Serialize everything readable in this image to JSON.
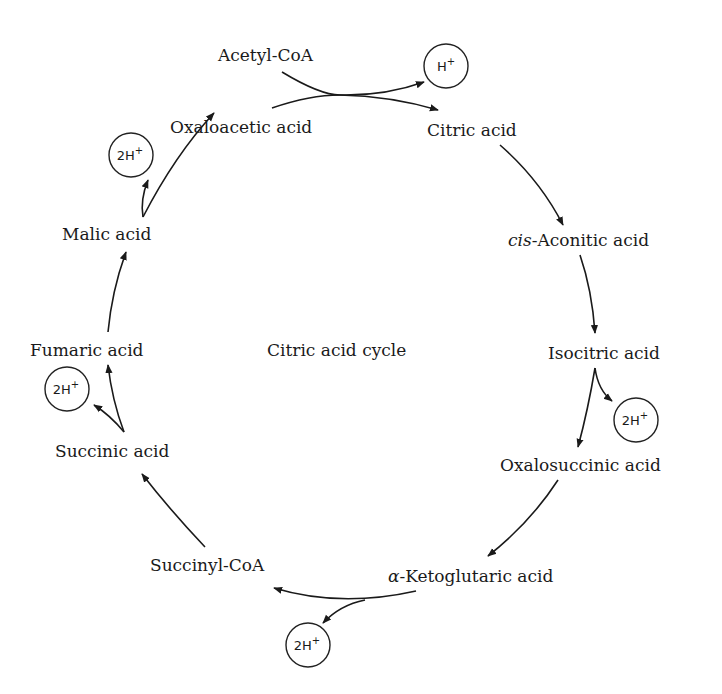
{
  "diagram": {
    "title": "Citric acid cycle",
    "nodes": [
      {
        "id": "acetyl_coa",
        "label": "Acetyl-CoA"
      },
      {
        "id": "oxaloacetic",
        "label": "Oxaloacetic acid"
      },
      {
        "id": "citric",
        "label": "Citric acid"
      },
      {
        "id": "cis_aconitic",
        "label_prefix": "cis",
        "label": "-Aconitic acid"
      },
      {
        "id": "isocitric",
        "label": "Isocitric acid"
      },
      {
        "id": "oxalosuccinic",
        "label": "Oxalosuccinic acid"
      },
      {
        "id": "ketoglutaric",
        "label_prefix": "α",
        "label": "-Ketoglutaric acid"
      },
      {
        "id": "succinyl_coa",
        "label": "Succinyl-CoA"
      },
      {
        "id": "succinic",
        "label": "Succinic acid"
      },
      {
        "id": "fumaric",
        "label": "Fumaric acid"
      },
      {
        "id": "malic",
        "label": "Malic acid"
      }
    ],
    "ions": [
      {
        "id": "h_citric",
        "text": "H",
        "sup": "+"
      },
      {
        "id": "h_isocitric",
        "text": "2H",
        "sup": "+"
      },
      {
        "id": "h_ketoglutaric",
        "text": "2H",
        "sup": "+"
      },
      {
        "id": "h_succinic",
        "text": "2H",
        "sup": "+"
      },
      {
        "id": "h_malic",
        "text": "2H",
        "sup": "+"
      }
    ],
    "edges": [
      {
        "from": "acetyl_coa+oxaloacetic",
        "to": "citric",
        "byproduct": "H+"
      },
      {
        "from": "citric",
        "to": "cis_aconitic"
      },
      {
        "from": "cis_aconitic",
        "to": "isocitric"
      },
      {
        "from": "isocitric",
        "to": "oxalosuccinic",
        "byproduct": "2H+"
      },
      {
        "from": "oxalosuccinic",
        "to": "ketoglutaric"
      },
      {
        "from": "ketoglutaric",
        "to": "succinyl_coa",
        "byproduct": "2H+"
      },
      {
        "from": "succinyl_coa",
        "to": "succinic"
      },
      {
        "from": "succinic",
        "to": "fumaric",
        "byproduct": "2H+"
      },
      {
        "from": "fumaric",
        "to": "malic"
      },
      {
        "from": "malic",
        "to": "oxaloacetic",
        "byproduct": "2H+"
      }
    ]
  }
}
